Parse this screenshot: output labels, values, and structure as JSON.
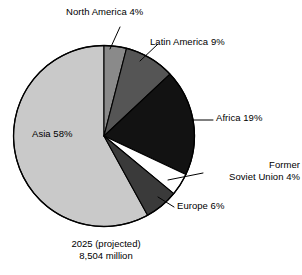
{
  "chart_data": {
    "type": "pie",
    "title": "",
    "subtitle": "",
    "xlabel": "",
    "ylabel": "",
    "legend_position": "none",
    "labels_position": "callout",
    "categories": [
      "North America",
      "Latin America",
      "Africa",
      "Former Soviet Union",
      "Europe",
      "Asia"
    ],
    "values": [
      4,
      9,
      19,
      4,
      6,
      58
    ],
    "unit": "%",
    "start_angle_deg": 0,
    "direction": "clockwise",
    "slices": [
      {
        "name": "North America",
        "label": "North America 4%",
        "value": 4,
        "color": "#8a8a8a",
        "start_deg": 0,
        "end_deg": 14.4
      },
      {
        "name": "Latin America",
        "label": "Latin America 9%",
        "value": 9,
        "color": "#555555",
        "start_deg": 14.4,
        "end_deg": 46.8
      },
      {
        "name": "Africa",
        "label": "Africa 19%",
        "value": 19,
        "color": "#121212",
        "start_deg": 46.8,
        "end_deg": 115.2
      },
      {
        "name": "Former Soviet Union",
        "label": "Former Soviet Union 4%",
        "label_line_1": "Former",
        "label_line_2": "Soviet Union 4%",
        "value": 4,
        "color": "#ffffff",
        "start_deg": 115.2,
        "end_deg": 129.6
      },
      {
        "name": "Europe",
        "label": "Europe 6%",
        "value": 6,
        "color": "#3a3a3a",
        "start_deg": 129.6,
        "end_deg": 151.2
      },
      {
        "name": "Asia",
        "label": "Asia 58%",
        "value": 58,
        "color": "#c9c9c9",
        "start_deg": 151.2,
        "end_deg": 360
      }
    ],
    "caption_line_1": "2025 (projected)",
    "caption_line_2": "8,504 million",
    "total_label": "8,504 million",
    "year_label": "2025 (projected)"
  },
  "labels": {
    "north_america": "North America 4%",
    "latin_america": "Latin America 9%",
    "africa": "Africa 19%",
    "former_soviet_line1": "Former",
    "former_soviet_line2": "Soviet Union 4%",
    "europe": "Europe 6%",
    "asia": "Asia 58%"
  },
  "caption": {
    "line1": "2025 (projected)",
    "line2": "8,504 million"
  },
  "colors": {
    "background": "#ffffff",
    "outline": "#000000",
    "north_america": "#8a8a8a",
    "latin_america": "#555555",
    "africa": "#121212",
    "former_soviet_union": "#ffffff",
    "europe": "#3a3a3a",
    "asia": "#c9c9c9",
    "text": "#000000"
  }
}
